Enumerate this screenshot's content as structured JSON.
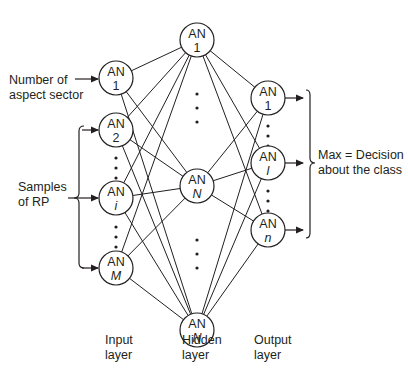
{
  "diagram": {
    "type": "neural-network",
    "colors": {
      "stroke": "#231f20",
      "background": "#ffffff"
    },
    "input_layer": {
      "label_line1": "Input",
      "label_line2": "layer",
      "nodes": [
        {
          "title": "AN",
          "index": "1",
          "italic": false
        },
        {
          "title": "AN",
          "index": "2",
          "italic": false
        },
        {
          "title": "AN",
          "index": "i",
          "italic": true
        },
        {
          "title": "AN",
          "index": "M",
          "italic": true
        }
      ]
    },
    "hidden_layer": {
      "label_line1": "Hidden",
      "label_line2": "layer",
      "nodes": [
        {
          "title": "AN",
          "index": "1",
          "italic": false
        },
        {
          "title": "AN",
          "index": "N",
          "italic": true
        },
        {
          "title": "AN",
          "index": "N",
          "italic": true
        }
      ]
    },
    "output_layer": {
      "label_line1": "Output",
      "label_line2": "layer",
      "nodes": [
        {
          "title": "AN",
          "index": "1",
          "italic": false
        },
        {
          "title": "AN",
          "index": "l",
          "italic": true
        },
        {
          "title": "AN",
          "index": "n",
          "italic": true
        }
      ]
    },
    "inputs": {
      "aspect_line1": "Number of",
      "aspect_line2": "aspect sector",
      "samples_line1": "Samples",
      "samples_line2": "of RP"
    },
    "output": {
      "decision_line1": "Max = Decision",
      "decision_line2": "about the class"
    }
  }
}
